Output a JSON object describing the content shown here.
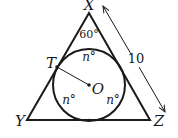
{
  "figure": {
    "vertices": {
      "X": "X",
      "Y": "Y",
      "Z": "Z"
    },
    "points": {
      "T": "T",
      "O": "O"
    },
    "angle_label": "60°",
    "arc_labels": [
      "n°",
      "n°",
      "n°"
    ],
    "side_length_label": "10",
    "colors": {
      "stroke": "#1a1a1a",
      "background": "#ffffff"
    }
  }
}
